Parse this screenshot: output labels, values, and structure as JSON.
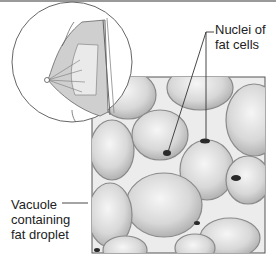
{
  "figure": {
    "labels": {
      "nuclei": [
        "Nuclei of",
        "fat cells"
      ],
      "vacuole": [
        "Vacuole",
        "containing",
        "fat droplet"
      ]
    },
    "colors": {
      "line": "#555555",
      "cell_fill": "#d9d9d9",
      "cell_highlight": "#f4f4f4",
      "background_tissue": "#ebebeb",
      "nucleus": "#2a2a2a"
    }
  }
}
